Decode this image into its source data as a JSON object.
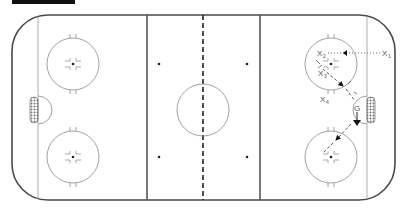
{
  "diagram": {
    "type": "hockey-rink-drill",
    "colors": {
      "boards": "#4a4a4a",
      "lines": "#555555",
      "circle": "#8a8a8a",
      "annotation": "#444444",
      "arrow": "#111111"
    }
  },
  "players": [
    {
      "id": "x1",
      "label": "X",
      "sub": "1"
    },
    {
      "id": "x2",
      "label": "X",
      "sub": "2"
    },
    {
      "id": "x3",
      "label": "X",
      "sub": "3"
    },
    {
      "id": "x4",
      "label": "X",
      "sub": "4"
    },
    {
      "id": "g",
      "label": "G",
      "sub": ""
    }
  ]
}
